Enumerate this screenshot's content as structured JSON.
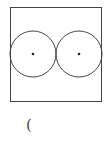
{
  "diagram": {
    "rectangle": {
      "x": 10,
      "y": 7,
      "width": 92,
      "height": 95,
      "stroke": "#444444"
    },
    "circles": [
      {
        "name": "left-circle",
        "cx": 33,
        "cy": 54,
        "r": 23,
        "center_dot": true
      },
      {
        "name": "right-circle",
        "cx": 79,
        "cy": 54,
        "r": 23,
        "center_dot": true
      }
    ],
    "caption": "("
  }
}
